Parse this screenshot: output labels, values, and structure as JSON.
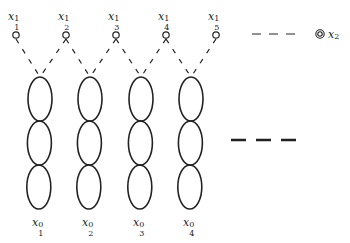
{
  "diagram": {
    "top_nodes": [
      {
        "var": "x",
        "sub": "1",
        "sup": "1",
        "cx": 16,
        "cy": 35
      },
      {
        "var": "x",
        "sub": "2",
        "sup": "1",
        "cx": 66,
        "cy": 35
      },
      {
        "var": "x",
        "sub": "3",
        "sup": "1",
        "cx": 116,
        "cy": 35
      },
      {
        "var": "x",
        "sub": "4",
        "sup": "1",
        "cx": 166,
        "cy": 35
      },
      {
        "var": "x",
        "sub": "5",
        "sup": "1",
        "cx": 216,
        "cy": 35
      }
    ],
    "chains": [
      {
        "var": "x",
        "sub": "1",
        "sup": "0",
        "cx": 40,
        "loops": 3
      },
      {
        "var": "x",
        "sub": "2",
        "sup": "0",
        "cx": 90,
        "loops": 3
      },
      {
        "var": "x",
        "sub": "3",
        "sup": "0",
        "cx": 141,
        "loops": 3
      },
      {
        "var": "x",
        "sub": "4",
        "sup": "0",
        "cx": 191,
        "loops": 3
      }
    ],
    "far_node": {
      "var": "x",
      "sup": "2",
      "cx": 320,
      "cy": 34
    },
    "ellipsis_top": "— — —",
    "ellipsis_mid": "— — —",
    "stroke_color": "#222222"
  }
}
